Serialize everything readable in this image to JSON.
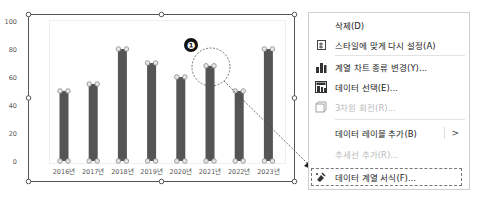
{
  "chart_data": {
    "type": "bar",
    "title": "",
    "xlabel": "",
    "ylabel": "",
    "categories": [
      "2016년",
      "2017년",
      "2018년",
      "2019년",
      "2020년",
      "2021년",
      "2022년",
      "2023년"
    ],
    "values": [
      50,
      55,
      80,
      70,
      60,
      68,
      50,
      80
    ],
    "yticks": [
      "0",
      "20",
      "40",
      "60",
      "80",
      "100"
    ],
    "ylim": [
      0,
      100
    ],
    "grid": false,
    "legend": "none",
    "selected_series": true,
    "bar_color": "#555555",
    "highlighted_category": "2021년"
  },
  "annotation": {
    "marker_label": "❶"
  },
  "context_menu": {
    "items": [
      {
        "label": "삭제(D)",
        "icon": "none",
        "enabled": true
      },
      {
        "label": "스타일에 맞게 다시 설정(A)",
        "icon": "reset-style-icon",
        "enabled": true
      },
      {
        "label": "계열 차트 종류 변경(Y)...",
        "icon": "bar-chart-icon",
        "enabled": true
      },
      {
        "label": "데이터 선택(E)...",
        "icon": "data-select-icon",
        "enabled": true
      },
      {
        "label": "3차원 회전(R)...",
        "icon": "3d-rotation-icon",
        "enabled": false
      },
      {
        "label": "데이터 레이블 추가(B)",
        "icon": "none",
        "enabled": true,
        "submenu": ">"
      },
      {
        "label": "추세선 추가(R)...",
        "icon": "none",
        "enabled": false
      },
      {
        "label": "데이터 계열 서식(F)...",
        "icon": "format-series-icon",
        "enabled": true,
        "highlighted": true
      }
    ]
  }
}
